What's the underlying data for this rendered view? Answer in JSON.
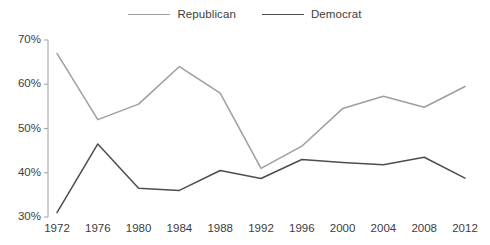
{
  "chart_data": {
    "type": "line",
    "title": "",
    "subtitle": "",
    "xlabel": "",
    "ylabel": "",
    "categories": [
      "1972",
      "1976",
      "1980",
      "1984",
      "1988",
      "1992",
      "1996",
      "2000",
      "2004",
      "2008",
      "2012"
    ],
    "x": [
      1972,
      1976,
      1980,
      1984,
      1988,
      1992,
      1996,
      2000,
      2004,
      2008,
      2012
    ],
    "series": [
      {
        "name": "Republican",
        "color": "#9e9e9e",
        "values": [
          67,
          52,
          55.5,
          64,
          58,
          41,
          46,
          54.5,
          57.3,
          54.8,
          59.5
        ]
      },
      {
        "name": "Democrat",
        "color": "#4d4d4d",
        "values": [
          31,
          46.5,
          36.5,
          36,
          40.5,
          38.7,
          43,
          42.3,
          41.8,
          43.5,
          38.8
        ]
      }
    ],
    "ylim": [
      30,
      70
    ],
    "yticks": [
      30,
      40,
      50,
      60,
      70
    ],
    "ytick_labels": [
      "30%",
      "40%",
      "50%",
      "60%",
      "70%"
    ],
    "xtick_labels": [
      "1972",
      "1976",
      "1980",
      "1984",
      "1988",
      "1992",
      "1996",
      "2000",
      "2004",
      "2008",
      "2012"
    ],
    "grid": false,
    "legend_position": "top-center",
    "legend_entries": [
      "Republican",
      "Democrat"
    ]
  },
  "legend": {
    "republican_label": "Republican",
    "democrat_label": "Democrat"
  },
  "axes": {
    "y_axis_name": "percent-axis",
    "x_axis_name": "year-axis"
  }
}
